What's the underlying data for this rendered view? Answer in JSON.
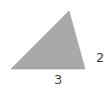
{
  "diagram": {
    "shape": "triangle",
    "fill_color": "#a9a9a9",
    "vertices": [
      [
        11,
        69
      ],
      [
        69,
        11
      ],
      [
        85,
        69
      ]
    ],
    "labels": {
      "base": "3",
      "right_side": "2"
    }
  }
}
